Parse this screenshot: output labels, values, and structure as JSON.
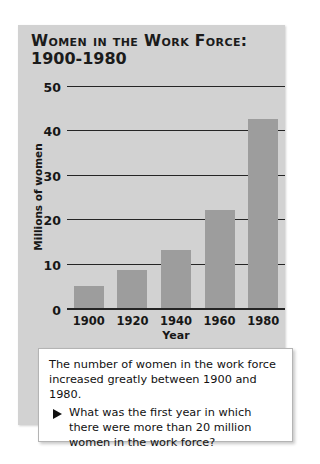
{
  "chart_data": {
    "type": "bar",
    "title": "WOMEN IN THE WORK FORCE: 1900-1980",
    "title_line1": "Women in the Work Force:",
    "title_line2": "1900-1980",
    "categories": [
      "1900",
      "1920",
      "1940",
      "1960",
      "1980"
    ],
    "values": [
      5,
      8.5,
      13,
      22,
      42.5
    ],
    "xlabel": "Year",
    "ylabel": "Millions of women",
    "ylim": [
      0,
      50
    ],
    "yticks": [
      0,
      10,
      20,
      30,
      40,
      50
    ],
    "ytick_labels": [
      "0",
      "10",
      "20",
      "30",
      "40",
      "50"
    ],
    "grid": true,
    "legend": "none",
    "bar_color": "#9d9d9d",
    "panel_color": "#d2d2d2",
    "axis_color": "#252525"
  },
  "caption": {
    "intro": "The number of women in the work force increased greatly between 1900 and 1980.",
    "bullet_icon": "triangle-right-icon",
    "question": "What was the first year in which there were more than 20 million women in the work force?"
  }
}
